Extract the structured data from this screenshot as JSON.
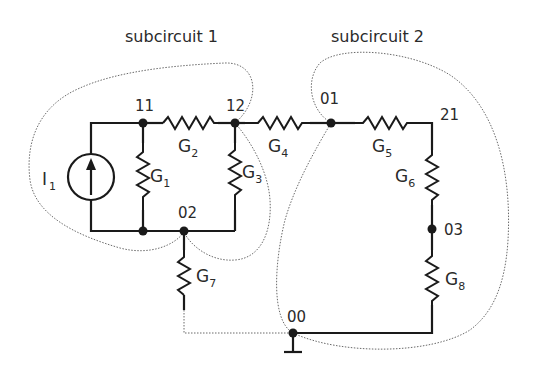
{
  "diagram": {
    "titles": {
      "subcircuit1": "subcircuit 1",
      "subcircuit2": "subcircuit 2"
    },
    "nodes": [
      {
        "id": "11",
        "label": "11"
      },
      {
        "id": "12",
        "label": "12"
      },
      {
        "id": "01",
        "label": "01"
      },
      {
        "id": "21",
        "label": "21"
      },
      {
        "id": "02",
        "label": "02"
      },
      {
        "id": "03",
        "label": "03"
      },
      {
        "id": "00",
        "label": "00"
      }
    ],
    "components": {
      "I1": {
        "main": "I",
        "sub": "1"
      },
      "G1": {
        "main": "G",
        "sub": "1"
      },
      "G2": {
        "main": "G",
        "sub": "2"
      },
      "G3": {
        "main": "G",
        "sub": "3"
      },
      "G4": {
        "main": "G",
        "sub": "4"
      },
      "G5": {
        "main": "G",
        "sub": "5"
      },
      "G6": {
        "main": "G",
        "sub": "6"
      },
      "G7": {
        "main": "G",
        "sub": "7"
      },
      "G8": {
        "main": "G",
        "sub": "8"
      }
    },
    "colors": {
      "wire": "#1a1a1a",
      "boundary": "#6a6a6a",
      "background": "#ffffff"
    }
  }
}
